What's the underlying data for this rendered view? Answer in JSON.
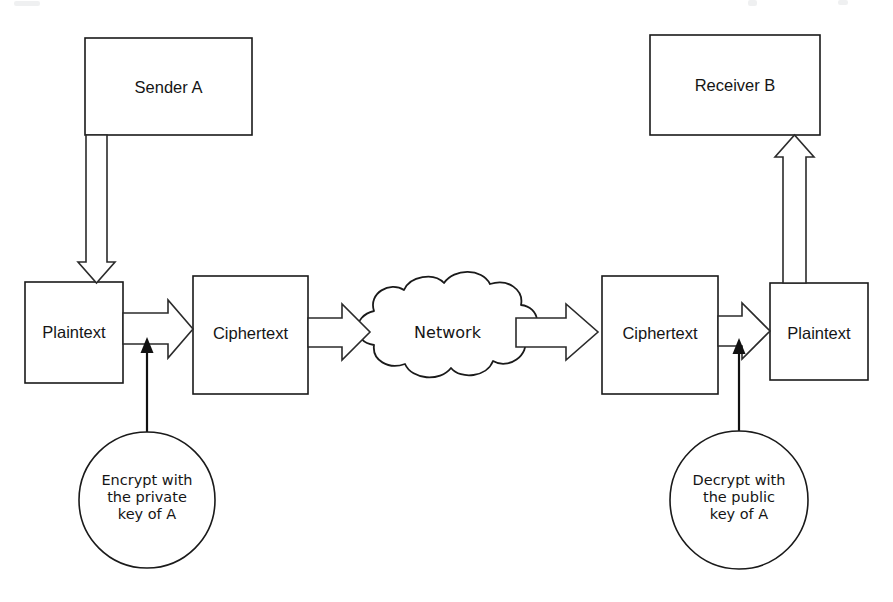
{
  "diagram": {
    "stroke_color": "#1a1a1a",
    "fill_color": "#ffffff",
    "nodes": {
      "sender": {
        "label": "Sender A",
        "shape": "rectangle"
      },
      "receiver": {
        "label": "Receiver B",
        "shape": "rectangle"
      },
      "plaintext_left": {
        "label": "Plaintext",
        "shape": "rectangle"
      },
      "ciphertext_left": {
        "label": "Ciphertext",
        "shape": "rectangle"
      },
      "network": {
        "label": "Network",
        "shape": "cloud"
      },
      "ciphertext_right": {
        "label": "Ciphertext",
        "shape": "rectangle"
      },
      "plaintext_right": {
        "label": "Plaintext",
        "shape": "rectangle"
      },
      "encrypt_note": {
        "label": "Encrypt with\nthe private\nkey of A",
        "shape": "circle"
      },
      "decrypt_note": {
        "label": "Decrypt with\nthe public\nkey of A",
        "shape": "circle"
      }
    },
    "edges": [
      {
        "from": "sender",
        "to": "plaintext_left",
        "style": "hollow-block-arrow",
        "direction": "down"
      },
      {
        "from": "plaintext_left",
        "to": "ciphertext_left",
        "style": "hollow-block-arrow",
        "direction": "right"
      },
      {
        "from": "ciphertext_left",
        "to": "network",
        "style": "hollow-block-arrow",
        "direction": "right"
      },
      {
        "from": "network",
        "to": "ciphertext_right",
        "style": "hollow-block-arrow",
        "direction": "right"
      },
      {
        "from": "ciphertext_right",
        "to": "plaintext_right",
        "style": "hollow-block-arrow",
        "direction": "right"
      },
      {
        "from": "plaintext_right",
        "to": "receiver",
        "style": "hollow-block-arrow",
        "direction": "up"
      },
      {
        "from": "encrypt_note",
        "to": "plaintext_left",
        "style": "thin-line-arrow",
        "direction": "up"
      },
      {
        "from": "decrypt_note",
        "to": "ciphertext_right",
        "style": "thin-line-arrow",
        "direction": "up"
      }
    ]
  }
}
